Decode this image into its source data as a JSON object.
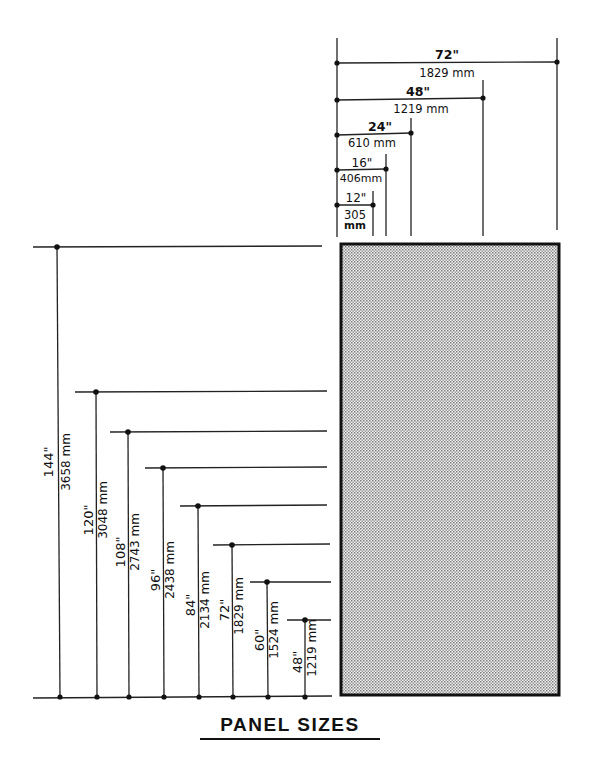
{
  "title": "PANEL SIZES",
  "colors": {
    "ink": "#111111",
    "panel_fill": "#d9d9d9",
    "background": "#ffffff"
  },
  "widths": [
    {
      "inches": "72\"",
      "mm": "1829 mm"
    },
    {
      "inches": "48\"",
      "mm": "1219 mm"
    },
    {
      "inches": "24\"",
      "mm": "610 mm"
    },
    {
      "inches": "16\"",
      "mm": "406mm"
    },
    {
      "inches": "12\"",
      "mm_line1": "305",
      "mm_line2": "mm"
    }
  ],
  "heights": [
    {
      "inches": "144\"",
      "mm": "3658 mm"
    },
    {
      "inches": "120\"",
      "mm": "3048 mm"
    },
    {
      "inches": "108\"",
      "mm": "2743 mm"
    },
    {
      "inches": "96\"",
      "mm": "2438 mm"
    },
    {
      "inches": "84\"",
      "mm": "2134 mm"
    },
    {
      "inches": "72\"",
      "mm": "1829 mm"
    },
    {
      "inches": "60\"",
      "mm": "1524 mm"
    },
    {
      "inches": "48\"",
      "mm": "1219 mm"
    }
  ]
}
